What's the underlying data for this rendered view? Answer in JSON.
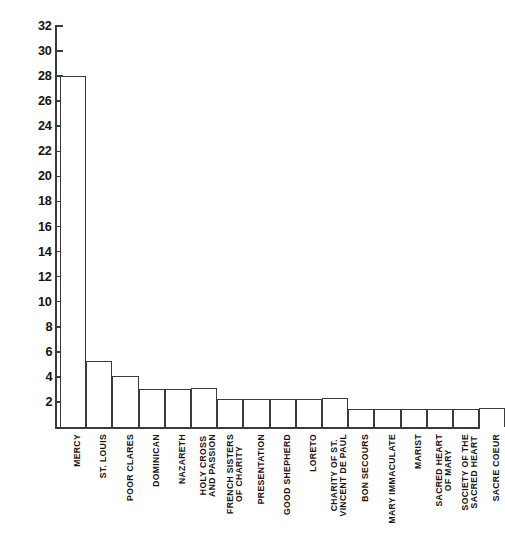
{
  "chart_data": {
    "type": "bar",
    "title": "",
    "subtitle": "",
    "xlabel": "",
    "ylabel": "",
    "ylim": [
      0,
      32
    ],
    "grid": false,
    "legend": false,
    "orientation": "vertical",
    "bar_style": {
      "fill": "#ffffff",
      "edge": "#3b3b3b"
    },
    "y_ticks": [
      2,
      4,
      6,
      8,
      10,
      12,
      14,
      16,
      18,
      20,
      22,
      24,
      26,
      28,
      30,
      32
    ],
    "y_tick_labels": [
      "2",
      "4",
      "6",
      "8",
      "10",
      "12",
      "14",
      "16",
      "18",
      "20",
      "22",
      "24",
      "26",
      "28",
      "30",
      "32"
    ],
    "categories": [
      "MERCY",
      "ST. LOUIS",
      "POOR CLARES",
      "DOMINICAN",
      "NAZARETH",
      "HOLY CROSS AND PASSION",
      "FRENCH SISTERS OF CHARITY",
      "PRESENTATION",
      "GOOD SHEPHERD",
      "LORETO",
      "CHARITY OF ST. VINCENT DE PAUL",
      "BON SECOURS",
      "MARY IMMACULATE",
      "MARIST",
      "SACRED HEART OF MARY",
      "SOCIETY OF THE SACRED HEART",
      "SACRE COEUR"
    ],
    "category_lines": [
      [
        "MERCY"
      ],
      [
        "ST. LOUIS"
      ],
      [
        "POOR CLARES"
      ],
      [
        "DOMINICAN"
      ],
      [
        "NAZARETH"
      ],
      [
        "HOLY CROSS",
        "AND PASSION"
      ],
      [
        "FRENCH SISTERS",
        "OF CHARITY"
      ],
      [
        "PRESENTATION"
      ],
      [
        "GOOD SHEPHERD"
      ],
      [
        "LORETO"
      ],
      [
        "CHARITY OF ST.",
        "VINCENT DE PAUL"
      ],
      [
        "BON SECOURS"
      ],
      [
        "MARY IMMACULATE"
      ],
      [
        "MARIST"
      ],
      [
        "SACRED HEART",
        "OF MARY"
      ],
      [
        "SOCIETY OF THE",
        "SACRED HEART"
      ],
      [
        "SACRE COEUR"
      ]
    ],
    "values": [
      28,
      5.3,
      4.1,
      3.0,
      3.0,
      3.1,
      2.2,
      2.2,
      2.25,
      2.25,
      2.3,
      1.4,
      1.4,
      1.4,
      1.45,
      1.45,
      1.5
    ]
  }
}
